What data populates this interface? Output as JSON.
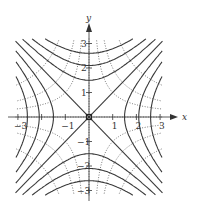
{
  "chart_data": {
    "type": "contour",
    "title": "",
    "xlabel": "x",
    "ylabel": "y",
    "xlim": [
      -3.1,
      3.1
    ],
    "ylim": [
      -3.2,
      3.2
    ],
    "x_ticks": [
      -3,
      -2,
      -1,
      1,
      2,
      3
    ],
    "x_tick_labels": [
      "−3",
      "",
      "−1",
      "1",
      "2",
      "3"
    ],
    "y_ticks": [
      -3,
      -2,
      -1,
      1,
      2,
      3
    ],
    "y_tick_labels": [
      "−3",
      "−2",
      "−1",
      "1",
      "2",
      "3"
    ],
    "solid_curves": {
      "description": "Hyperbolas x^2 - y^2 = c (solid)",
      "asymptotes": [
        "y = x",
        "y = -x"
      ],
      "horizontal_branch_vertices": [
        1.5,
        2.1,
        2.6
      ],
      "vertical_branch_vertices": [
        1.5,
        2.1,
        2.6
      ]
    },
    "dotted_curves": {
      "description": "Orthogonal hyperbolas xy = c (dotted)",
      "c_values": [
        1,
        2,
        4,
        -1,
        -2,
        -4
      ]
    },
    "critical_point": {
      "x": 0,
      "y": 0,
      "marker": "small square"
    },
    "grid": false
  },
  "colors": {
    "curve": "#3a3a3a",
    "axis": "#333333",
    "dotted": "#555555"
  }
}
